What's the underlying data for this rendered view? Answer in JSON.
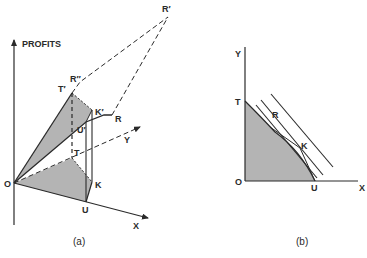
{
  "figure": {
    "panels": [
      {
        "id": "a",
        "caption": "(a)",
        "axis_vertical_label": "PROFITS",
        "labels": {
          "origin": "O",
          "x_axis": "X",
          "y_axis": "Y",
          "U": "U",
          "K": "K",
          "T": "T",
          "T_prime": "T′",
          "R_double_prime": "R″",
          "K_prime": "K′",
          "U_prime": "U′",
          "R": "R",
          "R_prime": "R′"
        }
      },
      {
        "id": "b",
        "caption": "(b)",
        "labels": {
          "origin": "O",
          "x_axis": "X",
          "y_axis": "Y",
          "T": "T",
          "U": "U",
          "R": "R",
          "K": "K"
        }
      }
    ],
    "colors": {
      "ink": "#2a2a2a",
      "shade": "#b4b4b4",
      "background": "#ffffff"
    }
  }
}
